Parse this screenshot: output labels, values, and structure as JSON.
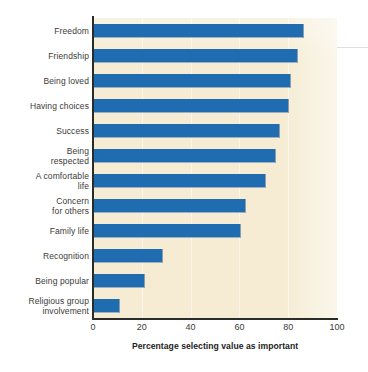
{
  "chart_data": {
    "type": "bar",
    "orientation": "horizontal",
    "title": "",
    "xlabel": "Percentage selecting value as important",
    "ylabel": "",
    "xlim": [
      0,
      100
    ],
    "xticks": [
      0,
      20,
      40,
      60,
      80,
      100
    ],
    "xtick_labels": [
      "0",
      "20",
      "40",
      "60",
      "80",
      "100"
    ],
    "grid": "vertical-faint",
    "legend": "none",
    "plot_background_color": "#f5ecd3",
    "bar_color": "#1f6cb0",
    "categories": [
      "Freedom",
      "Friendship",
      "Being loved",
      "Having choices",
      "Success",
      "Being\nrespected",
      "A comfortable\nlife",
      "Concern\nfor others",
      "Family life",
      "Recognition",
      "Being popular",
      "Religious group\ninvolvement"
    ],
    "values": [
      86.5,
      84,
      81,
      80.5,
      76.5,
      75,
      71,
      62.5,
      60.5,
      28.5,
      21.5,
      11
    ],
    "series": [
      {
        "name": "Percentage selecting value as important",
        "values": [
          86.5,
          84,
          81,
          80.5,
          76.5,
          75,
          71,
          62.5,
          60.5,
          28.5,
          21.5,
          11
        ]
      }
    ]
  }
}
